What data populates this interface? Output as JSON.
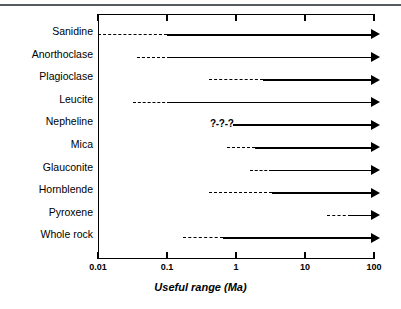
{
  "chart_data": {
    "type": "bar",
    "title": "",
    "subtitle": "",
    "xlabel": "Useful range (Ma)",
    "ylabel": "",
    "xscale": "log",
    "xlim": [
      0.01,
      100
    ],
    "xticks": [
      "0.01",
      "0.1",
      "1",
      "10",
      "100"
    ],
    "xtick_values": [
      0.01,
      0.1,
      1,
      10,
      100
    ],
    "grid": false,
    "legend": null,
    "orientation": "horizontal",
    "categories": [
      "Sanidine",
      "Anorthoclase",
      "Plagioclase",
      "Leucite",
      "Nepheline",
      "Mica",
      "Glauconite",
      "Hornblende",
      "Pyroxene",
      "Whole rock"
    ],
    "series": [
      {
        "name": "Uncertain / approximate lower limit (dashed)",
        "style": "dashed",
        "values": [
          {
            "category": "Sanidine",
            "start": 0.01,
            "end": 0.1
          },
          {
            "category": "Anorthoclase",
            "start": 0.037,
            "end": 0.11
          },
          {
            "category": "Plagioclase",
            "start": 0.4,
            "end": 2.5
          },
          {
            "category": "Leucite",
            "start": 0.032,
            "end": 0.11
          },
          {
            "category": "Nepheline",
            "start": 0.42,
            "end": 0.9,
            "annotation": "?-?-?"
          },
          {
            "category": "Mica",
            "start": 0.75,
            "end": 1.9
          },
          {
            "category": "Glauconite",
            "start": 1.6,
            "end": 3.3
          },
          {
            "category": "Hornblende",
            "start": 0.4,
            "end": 3.3
          },
          {
            "category": "Pyroxene",
            "start": 21,
            "end": 47
          },
          {
            "category": "Whole rock",
            "start": 0.17,
            "end": 0.64
          }
        ]
      },
      {
        "name": "Established useful range (solid, open-ended to older ages)",
        "style": "solid-arrow",
        "values": [
          {
            "category": "Sanidine",
            "start": 0.1,
            "end": 100,
            "open_ended": true
          },
          {
            "category": "Anorthoclase",
            "start": 0.11,
            "end": 100,
            "open_ended": true
          },
          {
            "category": "Plagioclase",
            "start": 2.5,
            "end": 100,
            "open_ended": true
          },
          {
            "category": "Leucite",
            "start": 0.11,
            "end": 100,
            "open_ended": true
          },
          {
            "category": "Nepheline",
            "start": 0.9,
            "end": 100,
            "open_ended": true
          },
          {
            "category": "Mica",
            "start": 1.9,
            "end": 100,
            "open_ended": true
          },
          {
            "category": "Glauconite",
            "start": 3.3,
            "end": 100,
            "open_ended": true
          },
          {
            "category": "Hornblende",
            "start": 3.3,
            "end": 100,
            "open_ended": true
          },
          {
            "category": "Pyroxene",
            "start": 47,
            "end": 100,
            "open_ended": true
          },
          {
            "category": "Whole rock",
            "start": 0.64,
            "end": 100,
            "open_ended": true
          }
        ]
      }
    ],
    "annotations": [
      {
        "category": "Nepheline",
        "text": "?-?-?",
        "x": 0.42
      }
    ]
  },
  "axis": {
    "x_label": "Useful range (Ma)",
    "ticks": [
      {
        "label": "0.01",
        "value": 0.01
      },
      {
        "label": "0.1",
        "value": 0.1
      },
      {
        "label": "1",
        "value": 1
      },
      {
        "label": "10",
        "value": 10
      },
      {
        "label": "100",
        "value": 100
      }
    ]
  },
  "rows": [
    {
      "label": "Sanidine",
      "dash_start": 0.01,
      "dash_end": 0.1,
      "query": null
    },
    {
      "label": "Anorthoclase",
      "dash_start": 0.037,
      "dash_end": 0.11,
      "query": null
    },
    {
      "label": "Plagioclase",
      "dash_start": 0.4,
      "dash_end": 2.5,
      "query": null
    },
    {
      "label": "Leucite",
      "dash_start": 0.032,
      "dash_end": 0.11,
      "query": null
    },
    {
      "label": "Nepheline",
      "dash_start": 0.42,
      "dash_end": 0.9,
      "query": "?-?-?"
    },
    {
      "label": "Mica",
      "dash_start": 0.75,
      "dash_end": 1.9,
      "query": null
    },
    {
      "label": "Glauconite",
      "dash_start": 1.6,
      "dash_end": 3.3,
      "query": null
    },
    {
      "label": "Hornblende",
      "dash_start": 0.4,
      "dash_end": 3.3,
      "query": null
    },
    {
      "label": "Pyroxene",
      "dash_start": 21,
      "dash_end": 47,
      "query": null
    },
    {
      "label": "Whole rock",
      "dash_start": 0.17,
      "dash_end": 0.64,
      "query": null
    }
  ]
}
